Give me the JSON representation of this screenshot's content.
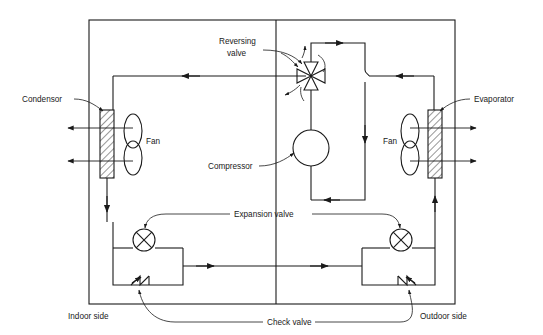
{
  "diagram": {
    "stroke_color": "#1a1a1a",
    "background_color": "#ffffff",
    "labels": {
      "condensor": "Condensor",
      "evaporator": "Evaporator",
      "fan_left": "Fan",
      "fan_right": "Fan",
      "reversing_valve_line1": "Reversing",
      "reversing_valve_line2": "valve",
      "compressor": "Compressor",
      "expansion_valve": "Expansion valve",
      "check_valve": "Check valve",
      "indoor_side": "Indoor side",
      "outdoor_side": "Outdoor side"
    },
    "components": [
      {
        "name": "condensor",
        "type": "heat-exchanger",
        "side": "indoor",
        "label": "Condensor"
      },
      {
        "name": "evaporator",
        "type": "heat-exchanger",
        "side": "outdoor",
        "label": "Evaporator"
      },
      {
        "name": "fan-indoor",
        "type": "fan",
        "side": "indoor",
        "label": "Fan"
      },
      {
        "name": "fan-outdoor",
        "type": "fan",
        "side": "outdoor",
        "label": "Fan"
      },
      {
        "name": "compressor",
        "type": "compressor",
        "side": "center",
        "label": "Compressor"
      },
      {
        "name": "reversing-valve",
        "type": "four-way-valve",
        "side": "center",
        "label": "Reversing valve"
      },
      {
        "name": "expansion-valve-indoor",
        "type": "expansion-valve",
        "side": "indoor",
        "label": "Expansion valve"
      },
      {
        "name": "expansion-valve-outdoor",
        "type": "expansion-valve",
        "side": "outdoor",
        "label": "Expansion valve"
      },
      {
        "name": "check-valve-indoor",
        "type": "check-valve",
        "side": "indoor",
        "label": "Check valve"
      },
      {
        "name": "check-valve-outdoor",
        "type": "check-valve",
        "side": "outdoor",
        "label": "Check valve"
      }
    ]
  }
}
